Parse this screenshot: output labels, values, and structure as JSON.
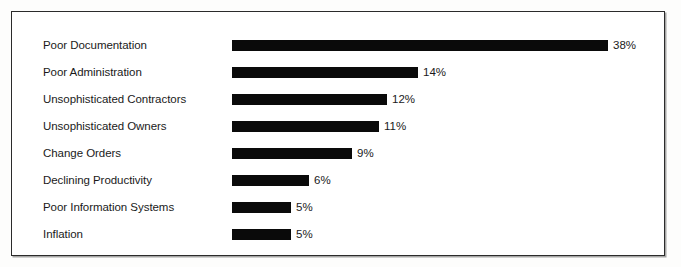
{
  "chart_data": {
    "type": "bar",
    "orientation": "horizontal",
    "title": "",
    "subtitle": "",
    "xlabel": "",
    "ylabel": "",
    "grid": false,
    "legend": null,
    "axis_ticks": [],
    "value_suffix": "%",
    "xlim": [
      0,
      38
    ],
    "categories": [
      "Poor Documentation",
      "Poor Administration",
      "Unsophisticated Contractors",
      "Unsophisticated Owners",
      "Change Orders",
      "Declining Productivity",
      "Poor Information Systems",
      "Inflation"
    ],
    "values": [
      38,
      14,
      12,
      11,
      9,
      6,
      5,
      5
    ],
    "data_labels": [
      "38%",
      "14%",
      "12%",
      "11%",
      "9%",
      "6%",
      "5%",
      "5%"
    ],
    "bars": [
      {
        "label": "Poor Documentation",
        "value": 38,
        "data_label": "38%",
        "bar_px": 376,
        "row_top": 22
      },
      {
        "label": "Poor Administration",
        "value": 14,
        "data_label": "14%",
        "bar_px": 186,
        "row_top": 49
      },
      {
        "label": "Unsophisticated Contractors",
        "value": 12,
        "data_label": "12%",
        "bar_px": 155,
        "row_top": 76
      },
      {
        "label": "Unsophisticated Owners",
        "value": 11,
        "data_label": "11%",
        "bar_px": 147,
        "row_top": 103
      },
      {
        "label": "Change Orders",
        "value": 9,
        "data_label": "9%",
        "bar_px": 120,
        "row_top": 130
      },
      {
        "label": "Declining Productivity",
        "value": 6,
        "data_label": "6%",
        "bar_px": 77,
        "row_top": 157
      },
      {
        "label": "Poor Information Systems",
        "value": 5,
        "data_label": "5%",
        "bar_px": 59,
        "row_top": 184
      },
      {
        "label": "Inflation",
        "value": 5,
        "data_label": "5%",
        "bar_px": 59,
        "row_top": 211
      }
    ],
    "colors": {
      "bar": "#0a0a0a",
      "text": "#1a1a1a",
      "frame": "#2b2b2b",
      "background": "#ffffff",
      "page_background": "#fdfdfc"
    }
  }
}
